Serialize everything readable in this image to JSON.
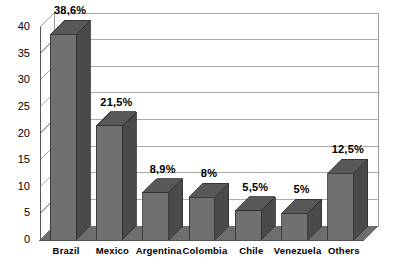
{
  "chart_data": {
    "type": "bar",
    "title": "",
    "subtitle": "",
    "xlabel": "",
    "ylabel": "",
    "categories": [
      "Brazil",
      "Mexico",
      "Argentina",
      "Colombia",
      "Chile",
      "Venezuela",
      "Others"
    ],
    "values": [
      38.6,
      21.5,
      8.9,
      8,
      5.5,
      5,
      12.5
    ],
    "data_labels": [
      "38,6%",
      "21,5%",
      "8,9%",
      "8%",
      "5,5%",
      "5%",
      "12,5%"
    ],
    "ylim": [
      0,
      40
    ],
    "ytick_step": 5,
    "ytick_labels": [
      "0",
      "5",
      "10",
      "15",
      "20",
      "25",
      "30",
      "35",
      "40"
    ],
    "ytick_values": [
      0,
      5,
      10,
      15,
      20,
      25,
      30,
      35,
      40
    ],
    "grid": "horizontal",
    "legend": "none",
    "style": "3d-column",
    "series": [
      {
        "name": "Share",
        "values": [
          38.6,
          21.5,
          8.9,
          8,
          5.5,
          5,
          12.5
        ]
      }
    ],
    "colors": {
      "bar_front": "#707070",
      "bar_side": "#4a4a4a",
      "bar_top": "#585858",
      "floor": "#6e6e6e",
      "gridline": "#aaaaaa",
      "frame": "#9a9a9a",
      "background": "#ffffff",
      "text": "#000000"
    }
  }
}
